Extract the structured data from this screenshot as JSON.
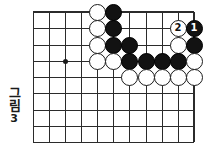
{
  "figure": {
    "caption_label": "그림",
    "caption_number": "3",
    "type": "go-board-diagram"
  },
  "board": {
    "colors": {
      "background": "#ffffff",
      "line": "#2b2b2b",
      "black_stone": "#121212",
      "white_stone": "#ffffff",
      "star_point": "#1a1a1a"
    },
    "geometry": {
      "x_coords": [
        33,
        49,
        65,
        81,
        97,
        113,
        129,
        146,
        162,
        178,
        194
      ],
      "y_coords": [
        12,
        28,
        45,
        61,
        77,
        93,
        110,
        126,
        142
      ],
      "stone_diameter": 17,
      "columns": 11,
      "rows": 9
    },
    "star_points": [
      {
        "col": 2,
        "row": 3
      }
    ],
    "stones": [
      {
        "col": 4,
        "row": 0,
        "color": "white",
        "label": ""
      },
      {
        "col": 5,
        "row": 0,
        "color": "black",
        "label": ""
      },
      {
        "col": 4,
        "row": 1,
        "color": "white",
        "label": ""
      },
      {
        "col": 5,
        "row": 1,
        "color": "black",
        "label": ""
      },
      {
        "col": 9,
        "row": 1,
        "color": "white",
        "label": "2"
      },
      {
        "col": 10,
        "row": 1,
        "color": "black",
        "label": "1"
      },
      {
        "col": 4,
        "row": 2,
        "color": "white",
        "label": ""
      },
      {
        "col": 5,
        "row": 2,
        "color": "black",
        "label": ""
      },
      {
        "col": 6,
        "row": 2,
        "color": "black",
        "label": ""
      },
      {
        "col": 9,
        "row": 2,
        "color": "white",
        "label": ""
      },
      {
        "col": 10,
        "row": 2,
        "color": "black",
        "label": ""
      },
      {
        "col": 4,
        "row": 3,
        "color": "white",
        "label": ""
      },
      {
        "col": 5,
        "row": 3,
        "color": "white",
        "label": ""
      },
      {
        "col": 6,
        "row": 3,
        "color": "black",
        "label": ""
      },
      {
        "col": 7,
        "row": 3,
        "color": "black",
        "label": ""
      },
      {
        "col": 8,
        "row": 3,
        "color": "black",
        "label": ""
      },
      {
        "col": 9,
        "row": 3,
        "color": "black",
        "label": ""
      },
      {
        "col": 10,
        "row": 3,
        "color": "white",
        "label": ""
      },
      {
        "col": 6,
        "row": 4,
        "color": "white",
        "label": ""
      },
      {
        "col": 7,
        "row": 4,
        "color": "white",
        "label": ""
      },
      {
        "col": 8,
        "row": 4,
        "color": "white",
        "label": ""
      },
      {
        "col": 9,
        "row": 4,
        "color": "white",
        "label": ""
      },
      {
        "col": 10,
        "row": 4,
        "color": "white",
        "label": ""
      }
    ]
  }
}
